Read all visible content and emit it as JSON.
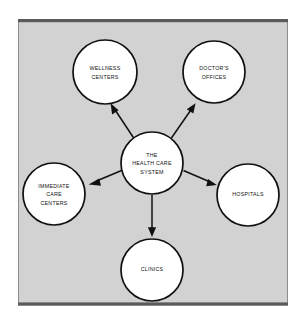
{
  "figure": {
    "title": "The Health Care System",
    "type": "hub-and-spoke concept map",
    "panel": {
      "background_color": "#d2d2d2",
      "rule_color": "#5a5a5a",
      "edge_color": "#8d8d8d"
    },
    "ink_color": "#101010"
  },
  "center_node": {
    "id": "health-care-system",
    "lines": [
      "THE",
      "HEALTH CARE",
      "SYSTEM"
    ],
    "line1": "THE",
    "line2": "HEALTH CARE",
    "line3": "SYSTEM"
  },
  "nodes": [
    {
      "id": "wellness-centers",
      "lines": [
        "WELLNESS",
        "CENTERS"
      ],
      "line1": "WELLNESS",
      "line2": "CENTERS",
      "position": "top-left"
    },
    {
      "id": "doctors-offices",
      "lines": [
        "DOCTOR'S",
        "OFFICES"
      ],
      "line1": "DOCTOR'S",
      "line2": "OFFICES",
      "position": "top-right"
    },
    {
      "id": "hospitals",
      "lines": [
        "HOSPITALS"
      ],
      "line1": "HOSPITALS",
      "position": "right"
    },
    {
      "id": "clinics",
      "lines": [
        "CLINICS"
      ],
      "line1": "CLINICS",
      "position": "bottom"
    },
    {
      "id": "immediate-care-centers",
      "lines": [
        "IMMEDIATE",
        "CARE",
        "CENTERS"
      ],
      "line1": "IMMEDIATE",
      "line2": "CARE",
      "line3": "CENTERS",
      "position": "left"
    }
  ],
  "connectors": [
    {
      "id": "to-wellness-centers",
      "from": "health-care-system",
      "to": "wellness-centers",
      "direction": "up-left"
    },
    {
      "id": "to-doctors-offices",
      "from": "health-care-system",
      "to": "doctors-offices",
      "direction": "up-right"
    },
    {
      "id": "to-hospitals",
      "from": "health-care-system",
      "to": "hospitals",
      "direction": "right-down"
    },
    {
      "id": "to-clinics",
      "from": "health-care-system",
      "to": "clinics",
      "direction": "down"
    },
    {
      "id": "to-immediate-care-centers",
      "from": "health-care-system",
      "to": "immediate-care-centers",
      "direction": "left-down"
    }
  ]
}
